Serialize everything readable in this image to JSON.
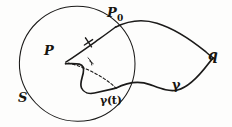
{
  "figure": {
    "kind": "hand-drawn-geometry-diagram",
    "width": 232,
    "height": 127,
    "ink_color": "#1b1a19",
    "background_color": "#fdfdfc",
    "labels": {
      "center_point": "P",
      "boundary_point_base": "P",
      "boundary_point_sub": "0",
      "disc": "S",
      "endpoint": "q",
      "curve": "γ",
      "curve_param": "γ(t)"
    },
    "elements": [
      {
        "name": "disc-boundary-circle",
        "label": "S",
        "center": [
          77,
          64
        ],
        "radius": 58
      },
      {
        "name": "geodesic-ray",
        "label": "P to P0",
        "from": [
          66,
          62
        ],
        "to": [
          116,
          27
        ],
        "tick": true
      },
      {
        "name": "dashed-segment",
        "label": "P to gamma(t)",
        "from": [
          68,
          64
        ],
        "to": [
          116,
          88
        ]
      },
      {
        "name": "angle-marker",
        "label": "angle at P",
        "vertex": [
          68,
          64
        ]
      },
      {
        "name": "curve-gamma",
        "label": "γ",
        "from": [
          66,
          64
        ],
        "through": [
          116,
          88
        ],
        "to": [
          213,
          58
        ]
      },
      {
        "name": "region-upper-arc",
        "label": "upper boundary",
        "from": [
          116,
          27
        ],
        "to": [
          213,
          58
        ]
      },
      {
        "name": "point-q",
        "label": "q",
        "at": [
          213,
          58
        ]
      },
      {
        "name": "point-P0",
        "label": "P0",
        "at": [
          116,
          27
        ]
      },
      {
        "name": "point-gamma-t",
        "label": "γ(t)",
        "at": [
          116,
          88
        ]
      }
    ]
  }
}
